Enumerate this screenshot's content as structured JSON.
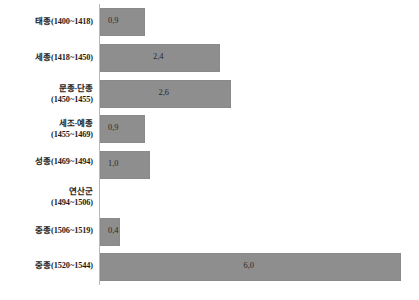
{
  "chart_data": {
    "type": "bar",
    "orientation": "horizontal",
    "title": "",
    "subtitle": "",
    "xlabel": "",
    "ylabel": "",
    "grid": false,
    "legend": false,
    "xlim": [
      0,
      6.1
    ],
    "axis_visible": "category-axis-only",
    "categories": [
      "태종(1400~1418)",
      "세종(1418~1450)",
      "문종·단종\n(1450~1455)",
      "세조·예종\n(1455~1469)",
      "성종(1469~1494)",
      "연산군\n(1494~1506)",
      "중종(1506~1519)",
      "중종(1520~1544)"
    ],
    "values": [
      0.9,
      2.4,
      2.6,
      0.9,
      1.0,
      null,
      0.4,
      6.0
    ],
    "value_labels": [
      "0,9",
      "2,4",
      "2,6",
      "0,9",
      "1,0",
      "",
      "0,4",
      "6,0"
    ],
    "bar_color": "#8e8e8e",
    "axis_color": "#b9b9b9",
    "text_color": "#1d1d1d"
  },
  "rows": [
    {
      "name": "태종",
      "years": "(1400~1418)",
      "two_line": false,
      "value": 0.9,
      "value_label": "0,9",
      "has_bar": true
    },
    {
      "name": "세종",
      "years": "(1418~1450)",
      "two_line": false,
      "value": 2.4,
      "value_label": "2,4",
      "has_bar": true
    },
    {
      "name": "문종·단종",
      "years": "(1450~1455)",
      "two_line": true,
      "value": 2.6,
      "value_label": "2,6",
      "has_bar": true
    },
    {
      "name": "세조·예종",
      "years": "(1455~1469)",
      "two_line": true,
      "value": 0.9,
      "value_label": "0,9",
      "has_bar": true
    },
    {
      "name": "성종",
      "years": "(1469~1494)",
      "two_line": false,
      "value": 1.0,
      "value_label": "1,0",
      "has_bar": true
    },
    {
      "name": "연산군",
      "years": "(1494~1506)",
      "two_line": true,
      "value": null,
      "value_label": "",
      "has_bar": false
    },
    {
      "name": "중종",
      "years": "(1506~1519)",
      "two_line": false,
      "value": 0.4,
      "value_label": "0,4",
      "has_bar": true
    },
    {
      "name": "중종",
      "years": "(1520~1544)",
      "two_line": false,
      "value": 6.0,
      "value_label": "6,0",
      "has_bar": true
    }
  ],
  "layout": {
    "axis_x": 99,
    "px_per_unit": 50.2,
    "bar_height": 28,
    "row_tops": [
      8,
      44,
      80,
      115,
      151,
      186,
      218,
      253
    ],
    "label_mid": [
      22,
      58,
      94,
      129,
      162,
      197,
      231,
      266
    ]
  }
}
